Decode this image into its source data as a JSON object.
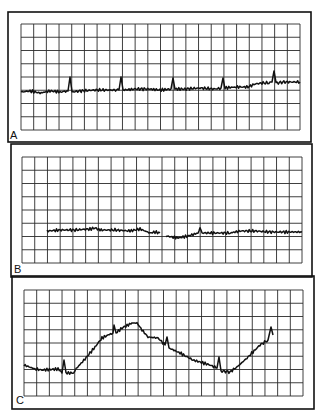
{
  "figure": {
    "background": "#ffffff",
    "ink": "#111111",
    "grid_color": "#2a2a2a",
    "panels": [
      {
        "label": "A",
        "frame": {
          "x": 8,
          "y": 12,
          "w": 303,
          "h": 130
        },
        "grid": {
          "x": 21,
          "y": 24,
          "w": 279,
          "h": 106,
          "cols": 22,
          "rows": 8
        },
        "label_pos": {
          "x": 10,
          "y": 130
        }
      },
      {
        "label": "B",
        "frame": {
          "x": 11,
          "y": 144,
          "w": 301,
          "h": 133
        },
        "grid": {
          "x": 22,
          "y": 157,
          "w": 280,
          "h": 106,
          "cols": 22,
          "rows": 8
        },
        "label_pos": {
          "x": 14,
          "y": 264
        }
      },
      {
        "label": "C",
        "frame": {
          "x": 12,
          "y": 276,
          "w": 302,
          "h": 133
        },
        "grid": {
          "x": 24,
          "y": 290,
          "w": 279,
          "h": 106,
          "cols": 22,
          "rows": 8
        },
        "label_pos": {
          "x": 16,
          "y": 395
        }
      }
    ]
  },
  "chart_data": [
    {
      "type": "line",
      "title": "A",
      "xlabel": "",
      "ylabel": "",
      "grid": true,
      "grid_divisions": {
        "x": 22,
        "y": 8
      },
      "description": "Nearly flat noisy trace with periodic sharp upward spikes; slight rise toward right end",
      "x": [
        21,
        30,
        40,
        50,
        60,
        68,
        70,
        72,
        80,
        95,
        110,
        119,
        121,
        123,
        135,
        150,
        160,
        171,
        173,
        175,
        185,
        200,
        215,
        221,
        223,
        225,
        235,
        248,
        255,
        262,
        270,
        272,
        274,
        276,
        285,
        300
      ],
      "y": [
        92,
        91,
        93,
        91,
        92,
        91,
        77,
        92,
        91,
        90,
        90,
        90,
        77,
        90,
        89,
        89,
        90,
        89,
        78,
        89,
        89,
        88,
        89,
        88,
        78,
        88,
        87,
        87,
        84,
        83,
        83,
        82,
        71,
        83,
        82,
        82
      ]
    },
    {
      "type": "line",
      "title": "B",
      "xlabel": "",
      "ylabel": "",
      "grid": true,
      "grid_divisions": {
        "x": 22,
        "y": 8
      },
      "description": "Flat low-amplitude trace starting at ~2nd grid column, with small gap near center",
      "segments": [
        {
          "x": [
            47,
            60,
            75,
            90,
            95,
            100,
            115,
            130,
            140,
            145,
            150,
            155,
            160
          ],
          "y": [
            231,
            230,
            230,
            229,
            228,
            230,
            230,
            231,
            229,
            231,
            233,
            232,
            233
          ]
        },
        {
          "x": [
            166,
            172,
            178,
            188,
            198,
            200,
            202,
            215,
            230,
            240,
            255,
            270,
            285,
            302
          ],
          "y": [
            236,
            237,
            238,
            236,
            233,
            228,
            233,
            233,
            233,
            231,
            231,
            232,
            232,
            232
          ]
        }
      ]
    },
    {
      "type": "line",
      "title": "C",
      "xlabel": "",
      "ylabel": "",
      "grid": true,
      "grid_divisions": {
        "x": 22,
        "y": 8
      },
      "description": "Slow undulating trace: low plateau, rise to broad peak, descent to trough, rise again; sharp spikes superimposed",
      "x": [
        24,
        35,
        42,
        58,
        62,
        64,
        66,
        72,
        75,
        85,
        95,
        102,
        108,
        113,
        114,
        116,
        122,
        132,
        137,
        142,
        148,
        158,
        165,
        167,
        169,
        180,
        193,
        210,
        217,
        219,
        221,
        230,
        237,
        247,
        260,
        268,
        271,
        273
      ],
      "y": [
        365,
        369,
        370,
        369,
        373,
        360,
        373,
        373,
        370,
        359,
        347,
        338,
        335,
        333,
        325,
        333,
        328,
        323,
        323,
        330,
        337,
        338,
        345,
        337,
        348,
        353,
        360,
        365,
        368,
        357,
        371,
        372,
        367,
        358,
        345,
        340,
        327,
        335
      ]
    }
  ]
}
